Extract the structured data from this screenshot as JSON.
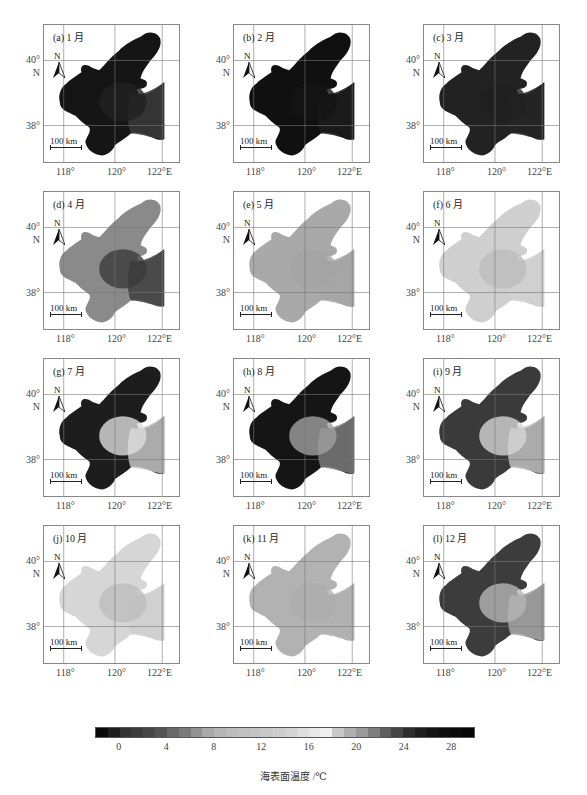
{
  "figure": {
    "colorbar": {
      "title": "海表面温度 /℃",
      "ticks": [
        "0",
        "4",
        "8",
        "12",
        "16",
        "20",
        "24",
        "28"
      ],
      "range": [
        -2,
        30
      ],
      "colors": [
        "#0a0a0a",
        "#1f1f1f",
        "#333333",
        "#3d3d3d",
        "#474747",
        "#545454",
        "#6a6a6a",
        "#7a7a7a",
        "#929292",
        "#a8a8a8",
        "#b4b4b4",
        "#bcbcbc",
        "#c0c0c0",
        "#c4c4c4",
        "#c8c8c8",
        "#cdcdcd",
        "#d4d4d4",
        "#dedede",
        "#e8e8e8",
        "#f0f0f0",
        "#c8c8c8",
        "#b0b0b0",
        "#9a9a9a",
        "#7e7e7e",
        "#5e5e5e",
        "#444444",
        "#2e2e2e",
        "#1e1e1e",
        "#141414",
        "#0e0e0e",
        "#0a0a0a",
        "#050505"
      ]
    },
    "axes": {
      "lat_labels": [
        "40°",
        "N",
        "38°"
      ],
      "lon_labels": [
        "118°",
        "120°",
        "122°E"
      ],
      "north_label": "N",
      "scale_label": "100 km"
    }
  },
  "chart_data": {
    "type": "heatmap",
    "xlabel": "Longitude (°E)",
    "ylabel": "Latitude (°N)",
    "x_ticks": [
      "118°",
      "120°",
      "122°E"
    ],
    "y_ticks": [
      "38°",
      "40° N"
    ],
    "colorbar_label": "海表面温度 /℃",
    "colorbar_ticks": [
      0,
      4,
      8,
      12,
      16,
      20,
      24,
      28
    ],
    "grid": true,
    "panels": [
      {
        "id": "a",
        "label": "(a) 1 月",
        "month": 1,
        "approx_sst_c": {
          "min": -1,
          "max": 4
        },
        "tone": "dark",
        "pattern": "uniform-dark, slightly lighter toward strait"
      },
      {
        "id": "b",
        "label": "(b) 2 月",
        "month": 2,
        "approx_sst_c": {
          "min": -1,
          "max": 3
        },
        "tone": "dark",
        "pattern": "uniform-dark"
      },
      {
        "id": "c",
        "label": "(c) 3 月",
        "month": 3,
        "approx_sst_c": {
          "min": 1,
          "max": 4
        },
        "tone": "dark",
        "pattern": "uniform-dark"
      },
      {
        "id": "d",
        "label": "(d) 4 月",
        "month": 4,
        "approx_sst_c": {
          "min": 4,
          "max": 9
        },
        "tone": "mixed",
        "pattern": "warmer coastal margins, cooler center"
      },
      {
        "id": "e",
        "label": "(e) 5 月",
        "month": 5,
        "approx_sst_c": {
          "min": 11,
          "max": 14
        },
        "tone": "light",
        "pattern": "nearly uniform"
      },
      {
        "id": "f",
        "label": "(f) 6 月",
        "month": 6,
        "approx_sst_c": {
          "min": 17,
          "max": 21
        },
        "tone": "light",
        "pattern": "warm coasts, cooler central"
      },
      {
        "id": "g",
        "label": "(g) 7 月",
        "month": 7,
        "approx_sst_c": {
          "min": 19,
          "max": 26
        },
        "tone": "mixed",
        "pattern": "warm west/north, cooler center-east"
      },
      {
        "id": "h",
        "label": "(h) 8 月",
        "month": 8,
        "approx_sst_c": {
          "min": 22,
          "max": 28
        },
        "tone": "dark",
        "pattern": "warm overall, cooler near strait"
      },
      {
        "id": "i",
        "label": "(i) 9 月",
        "month": 9,
        "approx_sst_c": {
          "min": 19,
          "max": 24
        },
        "tone": "mixed",
        "pattern": "warm west, cooler east"
      },
      {
        "id": "j",
        "label": "(j) 10 月",
        "month": 10,
        "approx_sst_c": {
          "min": 15,
          "max": 18
        },
        "tone": "light",
        "pattern": "light with central band"
      },
      {
        "id": "k",
        "label": "(k) 11 月",
        "month": 11,
        "approx_sst_c": {
          "min": 10,
          "max": 13
        },
        "tone": "light",
        "pattern": "nearly uniform"
      },
      {
        "id": "l",
        "label": "(l) 12 月",
        "month": 12,
        "approx_sst_c": {
          "min": 2,
          "max": 9
        },
        "tone": "mixed",
        "pattern": "cold coasts, warmer center/strait"
      }
    ]
  },
  "panels": [
    {
      "label": "(a) 1 月"
    },
    {
      "label": "(b) 2 月"
    },
    {
      "label": "(c) 3 月"
    },
    {
      "label": "(d) 4 月"
    },
    {
      "label": "(e) 5 月"
    },
    {
      "label": "(f) 6 月"
    },
    {
      "label": "(g) 7 月"
    },
    {
      "label": "(h) 8 月"
    },
    {
      "label": "(i) 9 月"
    },
    {
      "label": "(j) 10 月"
    },
    {
      "label": "(k) 11 月"
    },
    {
      "label": "(l) 12 月"
    }
  ],
  "render": {
    "fills": [
      {
        "base": "#151515",
        "east": "#3a3a3a",
        "center": "#202020"
      },
      {
        "base": "#101010",
        "east": "#1c1c1c",
        "center": "#141414"
      },
      {
        "base": "#222222",
        "east": "#242424",
        "center": "#202020"
      },
      {
        "base": "#8a8a8a",
        "east": "#3e3e3e",
        "center": "#3a3a3a"
      },
      {
        "base": "#a9a9a9",
        "east": "#a6a6a6",
        "center": "#a4a4a4"
      },
      {
        "base": "#cfcfcf",
        "east": "#d0d0d0",
        "center": "#bcbcbc"
      },
      {
        "base": "#1d1d1d",
        "east": "#c4c4c4",
        "center": "#dddddd"
      },
      {
        "base": "#151515",
        "east": "#7a7a7a",
        "center": "#a0a0a0"
      },
      {
        "base": "#3a3a3a",
        "east": "#c0c0c0",
        "center": "#d6d6d6"
      },
      {
        "base": "#d6d6d6",
        "east": "#cfcfcf",
        "center": "#bdbdbd"
      },
      {
        "base": "#b2b2b2",
        "east": "#b0b0b0",
        "center": "#adadad"
      },
      {
        "base": "#3c3c3c",
        "east": "#a8a8a8",
        "center": "#b5b5b5"
      }
    ]
  }
}
